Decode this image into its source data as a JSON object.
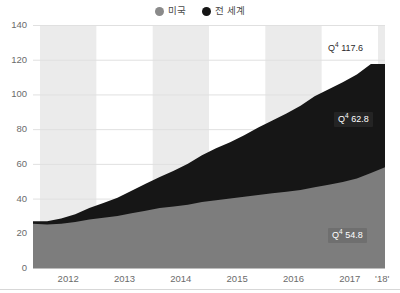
{
  "legend": {
    "position": "top-center",
    "items": [
      {
        "label": "미국",
        "color": "#8a8a8a",
        "icon": "circle-icon"
      },
      {
        "label": "전 세계",
        "color": "#151515",
        "icon": "circle-icon"
      }
    ]
  },
  "axes": {
    "y_ticks": [
      "0",
      "20",
      "40",
      "60",
      "80",
      "100",
      "120",
      "140"
    ],
    "y_values": [
      0,
      20,
      40,
      60,
      80,
      100,
      120,
      140
    ],
    "x_ticks": [
      "2012",
      "2013",
      "2014",
      "2015",
      "2016",
      "2017",
      "'18'"
    ],
    "ylim": [
      0,
      140
    ],
    "grid": "horizontal-light",
    "band_shading": "alternating-year-columns"
  },
  "callouts": [
    {
      "name": "total-callout",
      "q": "4",
      "value": "117.6",
      "text": "Q4 117.6",
      "style": "plain",
      "fg": "#2b2b2b",
      "bg": "none",
      "x": 328,
      "y": 43
    },
    {
      "name": "worldwide-callout",
      "q": "4",
      "value": "62.8",
      "text": "Q4 62.8",
      "style": "boxed",
      "fg": "#ffffff",
      "bg": "#242424",
      "x": 334,
      "y": 112
    },
    {
      "name": "us-callout",
      "q": "4",
      "value": "54.8",
      "text": "Q4 54.8",
      "style": "boxed",
      "fg": "#ffffff",
      "bg": "#6f6f6f",
      "x": 328,
      "y": 228
    }
  ],
  "colors": {
    "us_area": "#7d7d7d",
    "world_area": "#161616",
    "band": "#ebebeb",
    "plot_bg": "#ffffff",
    "grid": "#e0e0e0",
    "text": "#6b6b6b"
  },
  "chart_data": {
    "type": "area",
    "stacked": true,
    "title": "",
    "subtitle": "",
    "xlabel": "",
    "ylabel": "",
    "ylim": [
      0,
      140
    ],
    "grid": true,
    "legend_position": "top-center",
    "x_tick_labels": [
      "2012",
      "2013",
      "2014",
      "2015",
      "2016",
      "2017",
      "'18'"
    ],
    "x": [
      "2011 Q4",
      "2012 Q1",
      "2012 Q2",
      "2012 Q3",
      "2012 Q4",
      "2013 Q1",
      "2013 Q2",
      "2013 Q3",
      "2013 Q4",
      "2014 Q1",
      "2014 Q2",
      "2014 Q3",
      "2014 Q4",
      "2015 Q1",
      "2015 Q2",
      "2015 Q3",
      "2015 Q4",
      "2016 Q1",
      "2016 Q2",
      "2016 Q3",
      "2016 Q4",
      "2017 Q1",
      "2017 Q2",
      "2017 Q3",
      "2017 Q4",
      "2018 Q1"
    ],
    "series": [
      {
        "name": "미국",
        "color": "#7d7d7d",
        "values": [
          25.5,
          25.0,
          25.5,
          26.5,
          28.0,
          29.0,
          30.0,
          31.5,
          33.0,
          34.5,
          35.5,
          36.5,
          38.0,
          39.0,
          40.0,
          41.0,
          42.0,
          43.0,
          44.0,
          45.0,
          46.5,
          48.0,
          49.5,
          51.5,
          54.8,
          58.0
        ],
        "final_label": "Q4 54.8"
      },
      {
        "name": "전 세계",
        "color": "#161616",
        "values": [
          1.5,
          2.0,
          3.0,
          4.5,
          6.5,
          8.5,
          10.5,
          13.0,
          15.5,
          18.0,
          20.5,
          23.5,
          27.0,
          30.0,
          32.5,
          35.5,
          39.0,
          42.0,
          45.0,
          48.5,
          52.5,
          55.0,
          57.5,
          60.0,
          62.8,
          59.6
        ],
        "final_label": "Q4 62.8"
      }
    ],
    "totals": [
      27.0,
      27.0,
      28.5,
      31.0,
      34.5,
      37.5,
      40.5,
      44.5,
      48.5,
      52.5,
      56.0,
      60.0,
      65.0,
      69.0,
      72.5,
      76.5,
      81.0,
      85.0,
      89.0,
      93.5,
      99.0,
      103.0,
      107.0,
      111.5,
      117.6,
      117.6
    ],
    "total_label": "Q4 117.6"
  }
}
